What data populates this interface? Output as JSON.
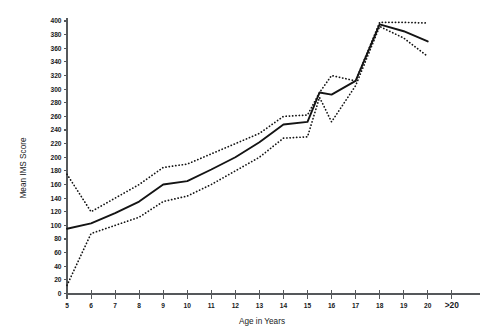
{
  "chart_data": {
    "type": "line",
    "title": "",
    "xlabel": "Age in Years",
    "ylabel": "Mean IMS Score",
    "x": [
      5,
      6,
      7,
      8,
      9,
      10,
      11,
      12,
      13,
      14,
      15,
      16,
      17,
      18,
      19,
      20
    ],
    "categories": [
      "5",
      "6",
      "7",
      "8",
      "9",
      "10",
      "11",
      "12",
      "13",
      "14",
      "15",
      "16",
      "17",
      "18",
      "19",
      "20",
      ">20"
    ],
    "xtick_labels": [
      "5",
      "6",
      "7",
      "8",
      "9",
      "10",
      "11",
      "12",
      "13",
      "14",
      "15",
      "16",
      "17",
      "18",
      "19",
      "20",
      ">20"
    ],
    "ytick_labels": [
      "0",
      "20",
      "40",
      "60",
      "80",
      "100",
      "120",
      "140",
      "160",
      "180",
      "200",
      "220",
      "240",
      "260",
      "280",
      "300",
      "320",
      "340",
      "360",
      "380",
      "400"
    ],
    "ytick_values": [
      0,
      20,
      40,
      60,
      80,
      100,
      120,
      140,
      160,
      180,
      200,
      220,
      240,
      260,
      280,
      300,
      320,
      340,
      360,
      380,
      400
    ],
    "xlim": [
      5,
      21
    ],
    "ylim": [
      0,
      400
    ],
    "grid": false,
    "legend": false,
    "legend_position": "none",
    "series": [
      {
        "name": "Upper bound",
        "style": "dotted",
        "values": [
          175,
          120,
          140,
          160,
          185,
          190,
          205,
          220,
          235,
          260,
          262,
          295,
          320,
          312,
          398,
          398,
          397
        ]
      },
      {
        "name": "Mean IMS Score",
        "style": "solid",
        "values": [
          95,
          103,
          118,
          135,
          160,
          165,
          182,
          200,
          222,
          248,
          252,
          295,
          292,
          312,
          395,
          385,
          370
        ]
      },
      {
        "name": "Lower bound",
        "style": "dotted",
        "values": [
          12,
          88,
          100,
          112,
          135,
          143,
          160,
          180,
          200,
          228,
          230,
          288,
          252,
          305,
          392,
          375,
          348
        ]
      }
    ],
    "series_x": [
      5,
      6,
      7,
      8,
      9,
      10,
      11,
      12,
      13,
      14,
      15,
      15.5,
      16,
      17,
      18,
      19,
      20
    ]
  },
  "axes": {
    "y_title": "Mean IMS Score",
    "x_title": "Age in Years"
  }
}
